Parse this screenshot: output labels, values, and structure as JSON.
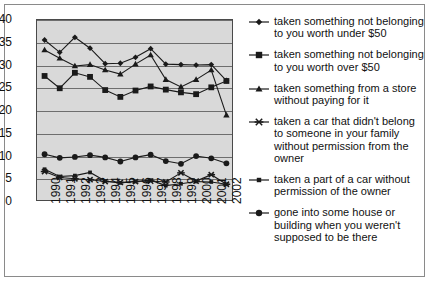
{
  "chart_data": {
    "type": "line",
    "title": "",
    "xlabel": "",
    "ylabel": "",
    "ylim": [
      0,
      40
    ],
    "ytick_step": 5,
    "grid": true,
    "legend_position": "right",
    "categories": [
      "1990",
      "1991",
      "1992",
      "1993",
      "1994",
      "1995",
      "1996",
      "1997",
      "1998",
      "1999",
      "2000",
      "2001",
      "2002"
    ],
    "series": [
      {
        "name": "taken something not belonging to you worth under $50",
        "marker": "diamond",
        "values": [
          35.6,
          32.9,
          36.2,
          33.8,
          30.4,
          30.5,
          31.8,
          33.7,
          30.3,
          30.2,
          30.1,
          30.2,
          26.7
        ]
      },
      {
        "name": "taken something not belonging to you worth over $50",
        "marker": "square",
        "values": [
          27.7,
          25.0,
          28.4,
          27.5,
          24.6,
          23.1,
          24.5,
          25.4,
          24.7,
          24.1,
          23.7,
          25.2,
          26.6
        ]
      },
      {
        "name": "taken something from a store without paying for it",
        "marker": "triangle",
        "values": [
          33.4,
          31.6,
          29.9,
          30.2,
          29.0,
          28.1,
          30.3,
          32.3,
          26.9,
          25.3,
          26.9,
          29.0,
          19.1
        ]
      },
      {
        "name": "taken a car that didn't belong to someone in your family without permission from the owner",
        "marker": "cross",
        "values": [
          6.7,
          5.4,
          5.1,
          4.9,
          4.5,
          4.3,
          4.5,
          4.6,
          4.4,
          6.4,
          4.6,
          6.0,
          3.9
        ]
      },
      {
        "name": "taken a part of a car without permission of the owner",
        "marker": "square-small",
        "values": [
          7.2,
          5.6,
          5.8,
          6.5,
          4.6,
          4.2,
          4.5,
          4.8,
          3.6,
          4.0,
          4.5,
          4.4,
          3.9
        ]
      },
      {
        "name": "gone into some house or building when you weren't supposed to be there",
        "marker": "circle",
        "values": [
          10.5,
          9.7,
          9.9,
          10.3,
          9.8,
          8.9,
          9.8,
          10.4,
          9.0,
          8.4,
          10.1,
          9.6,
          8.5
        ]
      }
    ],
    "yticks": [
      "40",
      "35",
      "30",
      "25",
      "20",
      "15",
      "10",
      "5",
      "0"
    ],
    "colors": {
      "line": "#1a1a1a",
      "plot_background": "#d9d9d9",
      "gridline": "#6e6e6e",
      "frame": "#8a8a8a",
      "text": "#111111"
    }
  },
  "legend": {
    "items": [
      {
        "label": "taken something not belonging to you worth under $50",
        "marker": "diamond"
      },
      {
        "label": "taken something not belonging to you worth over $50",
        "marker": "square"
      },
      {
        "label": "taken something from a store without paying for it",
        "marker": "triangle"
      },
      {
        "label": "taken a car that didn't belong to someone in your family without permission from the owner",
        "marker": "cross"
      },
      {
        "label": "taken a part of a car without permission of the owner",
        "marker": "square-small"
      },
      {
        "label": "gone into some house or building when you weren't supposed to be there",
        "marker": "circle"
      }
    ]
  }
}
